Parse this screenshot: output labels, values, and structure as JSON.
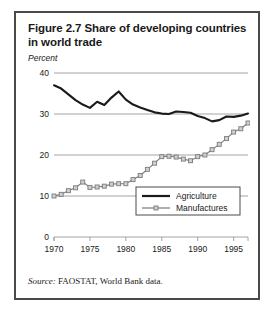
{
  "figure": {
    "title": "Figure 2.7  Share of developing countries in world trade",
    "unit_label": "Percent",
    "source_label": "Source:",
    "source_text": "FAOSTAT, World Bank data."
  },
  "legend": {
    "agriculture": "Agriculture",
    "manufactures": "Manufactures"
  },
  "colors": {
    "agriculture_line": "#1a1a1a",
    "manufactures_line": "#7a7a7a",
    "marker_fill": "#d0d0d0",
    "grid": "#9a9a9a",
    "frame": "#4a4a4a",
    "text": "#1a1a1a"
  },
  "chart_data": {
    "type": "line",
    "title": "Figure 2.7  Share of developing countries in world trade",
    "xlabel": "",
    "ylabel": "Percent",
    "xlim": [
      1970,
      1997
    ],
    "ylim": [
      0,
      40
    ],
    "yticks": [
      0,
      10,
      20,
      30,
      40
    ],
    "xticks": [
      1970,
      1975,
      1980,
      1985,
      1990,
      1995
    ],
    "grid": true,
    "legend_position": "inside-lower-right",
    "x": [
      1970,
      1971,
      1972,
      1973,
      1974,
      1975,
      1976,
      1977,
      1978,
      1979,
      1980,
      1981,
      1982,
      1983,
      1984,
      1985,
      1986,
      1987,
      1988,
      1989,
      1990,
      1991,
      1992,
      1993,
      1994,
      1995,
      1996,
      1997
    ],
    "series": [
      {
        "name": "Agriculture",
        "marker": "none",
        "values": [
          37.0,
          36.2,
          34.8,
          33.4,
          32.3,
          31.5,
          33.0,
          32.2,
          34.0,
          35.5,
          33.5,
          32.3,
          31.6,
          31.0,
          30.4,
          30.1,
          30.0,
          30.6,
          30.5,
          30.3,
          29.5,
          29.0,
          28.2,
          28.5,
          29.4,
          29.3,
          29.6,
          30.1
        ]
      },
      {
        "name": "Manufactures",
        "marker": "square",
        "values": [
          10.0,
          10.4,
          11.3,
          12.0,
          13.4,
          12.1,
          12.2,
          12.4,
          12.9,
          13.0,
          13.0,
          14.0,
          15.0,
          16.5,
          18.0,
          19.6,
          19.7,
          19.5,
          19.0,
          18.6,
          19.6,
          20.0,
          21.3,
          22.6,
          24.0,
          25.6,
          26.4,
          27.8
        ]
      }
    ]
  }
}
